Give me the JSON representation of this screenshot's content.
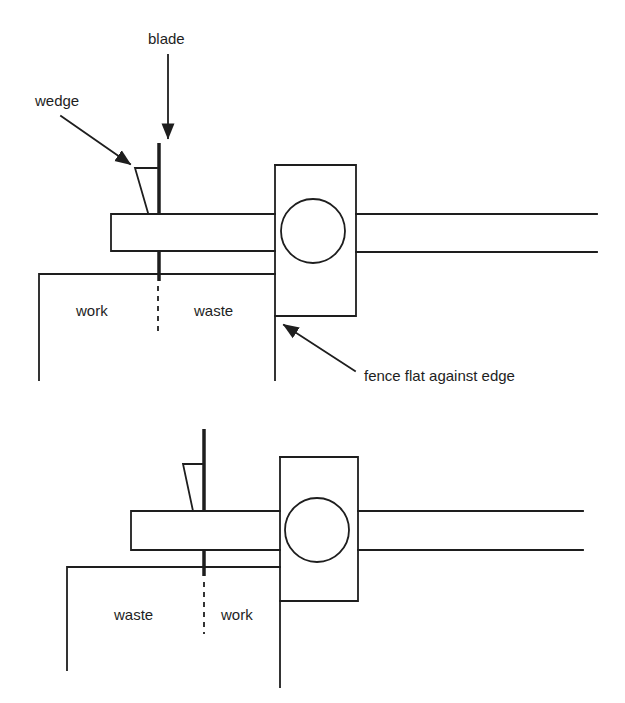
{
  "diagram": {
    "top": {
      "labels": {
        "blade": "blade",
        "wedge": "wedge",
        "left_region": "work",
        "right_region": "waste",
        "fence_note": "fence flat against edge"
      }
    },
    "bottom": {
      "labels": {
        "left_region": "waste",
        "right_region": "work"
      }
    },
    "colors": {
      "line": "#1e1e1e",
      "background": "#ffffff"
    }
  }
}
